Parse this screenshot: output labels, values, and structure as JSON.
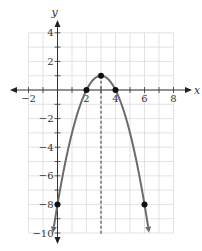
{
  "chart_data": {
    "type": "line",
    "title": "",
    "xlabel": "x",
    "ylabel": "y",
    "xlim": [
      -2,
      8
    ],
    "ylim": [
      -10,
      4
    ],
    "grid": true,
    "x_ticks": [
      -2,
      2,
      4,
      6,
      8
    ],
    "y_ticks": [
      4,
      2,
      -2,
      -4,
      -6,
      -8,
      -10
    ],
    "x_tick_labels": [
      "−2",
      "2",
      "4",
      "6",
      "8"
    ],
    "y_tick_labels": [
      "4",
      "2",
      "−2",
      "−4",
      "−6",
      "−8",
      "−10"
    ],
    "series": [
      {
        "name": "parabola",
        "equation": "y = -(x-3)^2 + 1",
        "color": "#6b6b6b",
        "x": [
          -0.3,
          0,
          1,
          2,
          3,
          4,
          5,
          6,
          6.3
        ],
        "y": [
          -9.89,
          -8,
          -3,
          0,
          1,
          0,
          -3,
          -8,
          -9.89
        ]
      }
    ],
    "points": [
      {
        "x": 0,
        "y": -8
      },
      {
        "x": 2,
        "y": 0
      },
      {
        "x": 3,
        "y": 1
      },
      {
        "x": 4,
        "y": 0
      },
      {
        "x": 6,
        "y": -8
      }
    ],
    "axis_of_symmetry": {
      "x": 3,
      "style": "dashed"
    },
    "annotations": []
  }
}
